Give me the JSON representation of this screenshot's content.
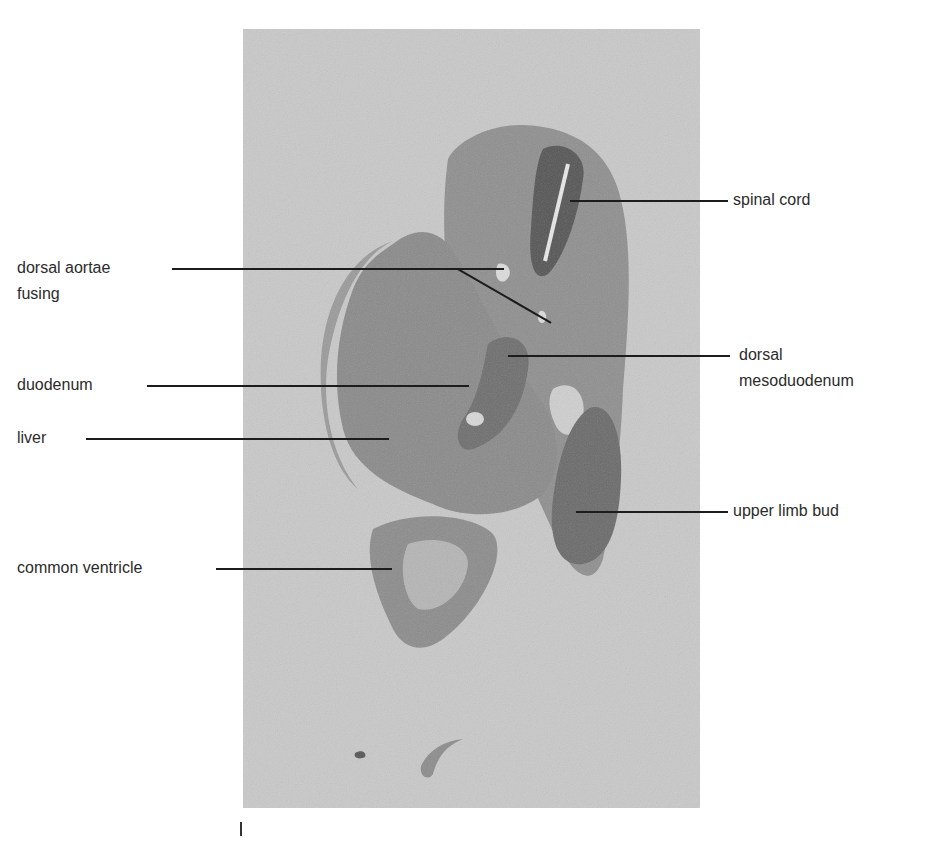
{
  "figure": {
    "type": "histology-section-micrograph",
    "panel_background": "#c9c9c9",
    "labels": [
      {
        "id": "spinal-cord",
        "text": "spinal cord",
        "side": "right"
      },
      {
        "id": "dorsal-aortae-fusing",
        "text": "dorsal aortae",
        "text2": "fusing",
        "side": "left"
      },
      {
        "id": "dorsal-mesoduodenum",
        "text": "dorsal",
        "text2": "mesoduodenum",
        "side": "right"
      },
      {
        "id": "duodenum",
        "text": "duodenum",
        "side": "left"
      },
      {
        "id": "liver",
        "text": "liver",
        "side": "left"
      },
      {
        "id": "upper-limb-bud",
        "text": "upper limb bud",
        "side": "right"
      },
      {
        "id": "common-ventricle",
        "text": "common ventricle",
        "side": "left"
      }
    ],
    "scale_mark": "|"
  }
}
